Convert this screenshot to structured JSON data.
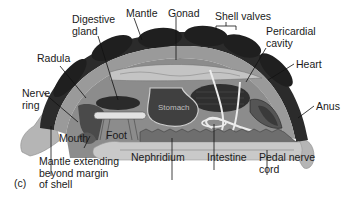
{
  "figure": {
    "panel_letter": "(c)",
    "colors": {
      "shell": "#2b2b2b",
      "mantle": "#9a9a9a",
      "body": "#b8b8b8",
      "foot": "#cfcfcf",
      "organs_dark": "#3a3a3a",
      "intestine": "#e8e8e8",
      "label_text": "#1a1a1a"
    }
  },
  "labels": {
    "digestive_gland": "Digestive\ngland",
    "mantle": "Mantle",
    "gonad": "Gonad",
    "shell_valves": "Shell valves",
    "pericardial_cavity": "Pericardial\ncavity",
    "heart": "Heart",
    "radula": "Radula",
    "nerve_ring": "Nerve\nring",
    "anus": "Anus",
    "mouth": "Mouth",
    "foot": "Foot",
    "stomach": "Stomach",
    "nephridium": "Nephridium",
    "intestine": "Intestine",
    "pedal_nerve_cord": "Pedal nerve\ncord",
    "mantle_extending": "Mantle extending\nbeyond margin\nof shell"
  }
}
